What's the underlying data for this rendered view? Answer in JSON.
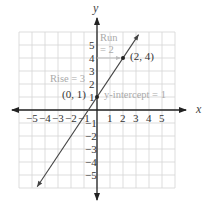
{
  "chart_data": {
    "type": "line",
    "title": "",
    "xlabel": "x",
    "ylabel": "y",
    "xlim": [
      -6,
      6
    ],
    "ylim": [
      -6,
      6
    ],
    "grid": true,
    "x_ticks": [
      "−5",
      "−4",
      "−3",
      "−2",
      "−1",
      "1",
      "2",
      "3",
      "4",
      "5"
    ],
    "y_ticks": [
      "5",
      "4",
      "3",
      "2",
      "1",
      "−1",
      "−2",
      "−3",
      "−4",
      "−5"
    ],
    "series": [
      {
        "name": "y = (3/2)x + 1",
        "slope": 1.5,
        "intercept": 1,
        "x": [
          -4.6,
          3.2
        ],
        "y": [
          -5.9,
          5.8
        ]
      }
    ],
    "points": [
      {
        "label": "(0, 1)",
        "x": 0,
        "y": 1
      },
      {
        "label": "(2, 4)",
        "x": 2,
        "y": 4
      }
    ],
    "annotations": {
      "run_line1": "Run",
      "run_line2": "= 2",
      "rise": "Rise = 3",
      "intercept": "y-intercept = 1",
      "point_a": "(0, 1)",
      "point_b": "(2, 4)"
    }
  }
}
